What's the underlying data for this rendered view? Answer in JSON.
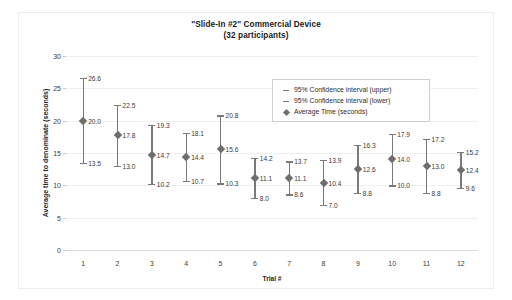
{
  "chart_data": {
    "type": "scatter",
    "title": "\"Slide-In #2\" Commercial Device",
    "subtitle": "(32 participants)",
    "xlabel": "Trial #",
    "ylabel": "Average time to denominate (seconds)",
    "ylim": [
      0,
      30
    ],
    "yticks": [
      0,
      5,
      10,
      15,
      20,
      25,
      30
    ],
    "grid": true,
    "legend_position": "top-right",
    "categories": [
      "1",
      "2",
      "3",
      "4",
      "5",
      "6",
      "7",
      "8",
      "9",
      "10",
      "11",
      "12"
    ],
    "series": [
      {
        "name": "95% Confidence interval (upper)",
        "values": [
          26.6,
          22.5,
          19.3,
          18.1,
          20.8,
          14.2,
          13.7,
          13.9,
          16.3,
          17.9,
          17.2,
          15.2
        ]
      },
      {
        "name": "Average Time (seconds)",
        "values": [
          20.0,
          17.8,
          14.7,
          14.4,
          15.6,
          11.1,
          11.1,
          10.4,
          12.6,
          14.0,
          13.0,
          12.4
        ]
      },
      {
        "name": "95% Confidence interval (lower)",
        "values": [
          13.5,
          13.0,
          10.2,
          10.7,
          10.3,
          8.0,
          8.6,
          7.0,
          8.8,
          10.0,
          8.8,
          9.6
        ]
      }
    ],
    "legend": [
      {
        "glyph": "dash",
        "label": "95% Confidence interval (upper)"
      },
      {
        "glyph": "dash",
        "label": "95% Confidence interval (lower)"
      },
      {
        "glyph": "diamond",
        "label": "Average Time (seconds)"
      }
    ],
    "colors": {
      "marker": "#6e6e6e",
      "error_bar": "#7a7a7a",
      "gridline": "#f0f0f0",
      "axis": "#d9d9d9",
      "text": "#262626"
    }
  }
}
